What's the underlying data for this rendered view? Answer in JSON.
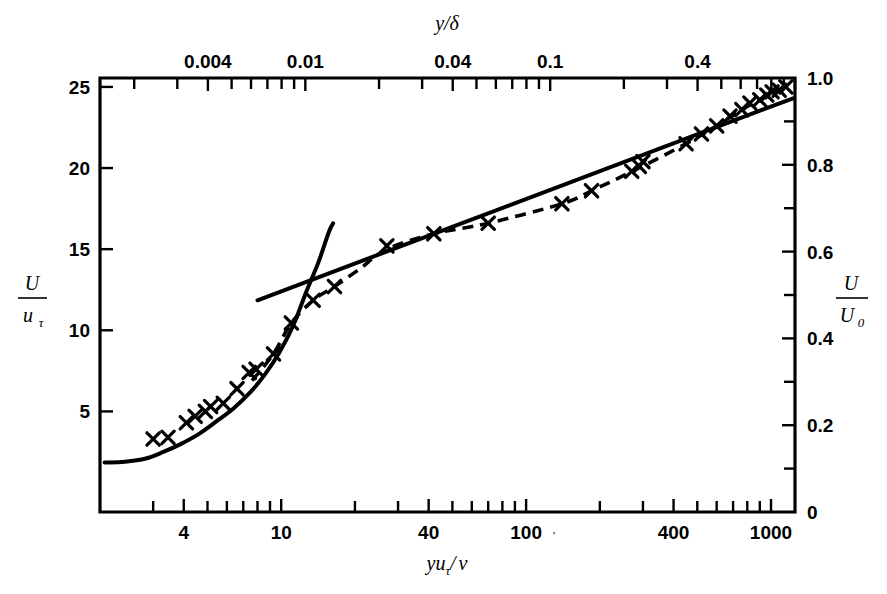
{
  "figure": {
    "background": "#ffffff",
    "ink_color": "#000000",
    "plot_box": {
      "left": 100,
      "right": 795,
      "top": 78,
      "bottom": 512
    }
  },
  "chart_data": {
    "type": "line",
    "title": "",
    "subtitle": "",
    "xlabel": "y uτ / ν",
    "xlabel_parts": {
      "y": "y",
      "u": "u",
      "tau": "τ",
      "slash": "/",
      "nu": "ν"
    },
    "ylabel": "U / uτ",
    "ylabel_parts": {
      "num": "U",
      "den": "u",
      "den_sub": "τ"
    },
    "secondary_xlabel": "y/δ",
    "secondary_ylabel": "U / U0",
    "secondary_ylabel_parts": {
      "num": "U",
      "den": "U",
      "den_sub": "0"
    },
    "xscale": "log",
    "yscale": "linear",
    "xlim": [
      1.82,
      1253
    ],
    "ylim": [
      -1.2,
      25.55
    ],
    "secondary_xlim": [
      0.00145,
      1.0
    ],
    "secondary_ylim": [
      0.0,
      1.0
    ],
    "grid": false,
    "legend": null,
    "x_ticks_labeled": [
      {
        "value": 4,
        "label": "4"
      },
      {
        "value": 10,
        "label": "10"
      },
      {
        "value": 40,
        "label": "40"
      },
      {
        "value": 100,
        "label": "100"
      },
      {
        "value": 400,
        "label": "400"
      },
      {
        "value": 1000,
        "label": "1000"
      }
    ],
    "x_ticks_minor": [
      3,
      5,
      6,
      7,
      8,
      9,
      20,
      30,
      50,
      60,
      70,
      80,
      90,
      200,
      300,
      500,
      600,
      700,
      800,
      900
    ],
    "top_ticks_labeled": [
      {
        "value": 0.004,
        "label": "0.004"
      },
      {
        "value": 0.01,
        "label": "0.01"
      },
      {
        "value": 0.04,
        "label": "0.04"
      },
      {
        "value": 0.1,
        "label": "0.1"
      },
      {
        "value": 0.4,
        "label": "0.4"
      }
    ],
    "top_ticks_minor": [
      0.002,
      0.003,
      0.005,
      0.006,
      0.007,
      0.008,
      0.009,
      0.02,
      0.03,
      0.05,
      0.06,
      0.07,
      0.08,
      0.09,
      0.2,
      0.3,
      0.5,
      0.6,
      0.7,
      0.8,
      0.9,
      1.0
    ],
    "y_ticks_left": [
      {
        "value": 25,
        "label": "25"
      },
      {
        "value": 20,
        "label": "20"
      },
      {
        "value": 15,
        "label": "15"
      },
      {
        "value": 10,
        "label": "10"
      },
      {
        "value": 5,
        "label": "5"
      }
    ],
    "y_ticks_right_labeled": [
      {
        "value": 1.0,
        "label": "1.0"
      },
      {
        "value": 0.8,
        "label": "0.8"
      },
      {
        "value": 0.6,
        "label": "0.6"
      },
      {
        "value": 0.4,
        "label": "0.4"
      },
      {
        "value": 0.2,
        "label": "0.2"
      },
      {
        "value": 0.0,
        "label": "0"
      }
    ],
    "y_ticks_right_minor": [
      0.9,
      0.7,
      0.5,
      0.3,
      0.1
    ],
    "series": [
      {
        "name": "measurements",
        "style": "cross-markers",
        "marker": "x",
        "points": [
          {
            "x": 3.0,
            "y": 3.3
          },
          {
            "x": 3.45,
            "y": 3.4
          },
          {
            "x": 4.1,
            "y": 4.3
          },
          {
            "x": 4.45,
            "y": 4.7
          },
          {
            "x": 4.9,
            "y": 5.0
          },
          {
            "x": 5.15,
            "y": 5.3
          },
          {
            "x": 5.8,
            "y": 5.5
          },
          {
            "x": 6.6,
            "y": 6.4
          },
          {
            "x": 7.4,
            "y": 7.4
          },
          {
            "x": 7.9,
            "y": 7.6
          },
          {
            "x": 9.3,
            "y": 8.55
          },
          {
            "x": 11.0,
            "y": 10.45
          },
          {
            "x": 13.5,
            "y": 11.85
          },
          {
            "x": 16.5,
            "y": 12.7
          },
          {
            "x": 27.0,
            "y": 15.2
          },
          {
            "x": 42.0,
            "y": 15.95
          },
          {
            "x": 70.0,
            "y": 16.6
          },
          {
            "x": 140.0,
            "y": 17.8
          },
          {
            "x": 185.0,
            "y": 18.6
          },
          {
            "x": 270.0,
            "y": 19.8
          },
          {
            "x": 290.0,
            "y": 20.1
          },
          {
            "x": 300.0,
            "y": 20.4
          },
          {
            "x": 450.0,
            "y": 21.5
          },
          {
            "x": 520.0,
            "y": 22.1
          },
          {
            "x": 600.0,
            "y": 22.6
          },
          {
            "x": 680.0,
            "y": 23.2
          },
          {
            "x": 760.0,
            "y": 23.6
          },
          {
            "x": 820.0,
            "y": 24.0
          },
          {
            "x": 900.0,
            "y": 24.2
          },
          {
            "x": 960.0,
            "y": 24.5
          },
          {
            "x": 1010.0,
            "y": 24.7
          },
          {
            "x": 1080.0,
            "y": 24.8
          },
          {
            "x": 1150.0,
            "y": 25.0
          }
        ]
      },
      {
        "name": "fitted-data-curve",
        "style": "dashed",
        "points": [
          {
            "x": 7.6,
            "y": 6.9
          },
          {
            "x": 9.3,
            "y": 8.55
          },
          {
            "x": 11.0,
            "y": 10.45
          },
          {
            "x": 13.5,
            "y": 11.85
          },
          {
            "x": 16.5,
            "y": 12.7
          },
          {
            "x": 21.0,
            "y": 13.8
          },
          {
            "x": 27.0,
            "y": 15.0
          },
          {
            "x": 42.0,
            "y": 15.95
          },
          {
            "x": 70.0,
            "y": 16.6
          },
          {
            "x": 140.0,
            "y": 17.8
          },
          {
            "x": 185.0,
            "y": 18.6
          },
          {
            "x": 280.0,
            "y": 19.9
          },
          {
            "x": 450.0,
            "y": 21.5
          },
          {
            "x": 600.0,
            "y": 22.6
          },
          {
            "x": 760.0,
            "y": 23.6
          },
          {
            "x": 900.0,
            "y": 24.2
          },
          {
            "x": 1050.0,
            "y": 24.75
          },
          {
            "x": 1150.0,
            "y": 25.0
          }
        ]
      },
      {
        "name": "viscous-sublayer-curve",
        "style": "solid",
        "points": [
          {
            "x": 1.9,
            "y": 1.85
          },
          {
            "x": 2.3,
            "y": 1.9
          },
          {
            "x": 2.8,
            "y": 2.1
          },
          {
            "x": 3.3,
            "y": 2.5
          },
          {
            "x": 3.9,
            "y": 3.0
          },
          {
            "x": 4.6,
            "y": 3.6
          },
          {
            "x": 5.4,
            "y": 4.35
          },
          {
            "x": 6.4,
            "y": 5.2
          },
          {
            "x": 7.5,
            "y": 6.2
          },
          {
            "x": 8.6,
            "y": 7.3
          },
          {
            "x": 9.8,
            "y": 8.6
          },
          {
            "x": 11.2,
            "y": 10.3
          },
          {
            "x": 12.6,
            "y": 12.3
          },
          {
            "x": 14.2,
            "y": 14.2
          },
          {
            "x": 15.6,
            "y": 16.0
          },
          {
            "x": 16.3,
            "y": 16.6
          }
        ]
      },
      {
        "name": "log-law-line",
        "style": "solid-straight",
        "points": [
          {
            "x": 8.0,
            "y": 11.85
          },
          {
            "x": 1230.0,
            "y": 24.3
          }
        ]
      }
    ]
  }
}
